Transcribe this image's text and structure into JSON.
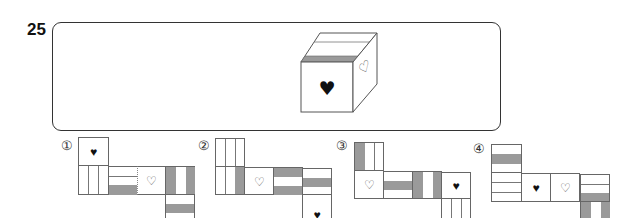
{
  "question": {
    "number": "25"
  },
  "cube": {
    "front_symbol": "♥",
    "side_symbol": "♡",
    "front_symbol_name": "solid-heart",
    "side_symbol_name": "outline-heart",
    "top_band_color": "#9a9a9a"
  },
  "options": [
    {
      "label": "①",
      "number": 1
    },
    {
      "label": "②",
      "number": 2
    },
    {
      "label": "③",
      "number": 3
    },
    {
      "label": "④",
      "number": 4
    }
  ],
  "symbols": {
    "solid_heart": "♥",
    "outline_heart": "♡"
  },
  "colors": {
    "stripe_gray": "#9a9a9a",
    "line": "#666666"
  }
}
